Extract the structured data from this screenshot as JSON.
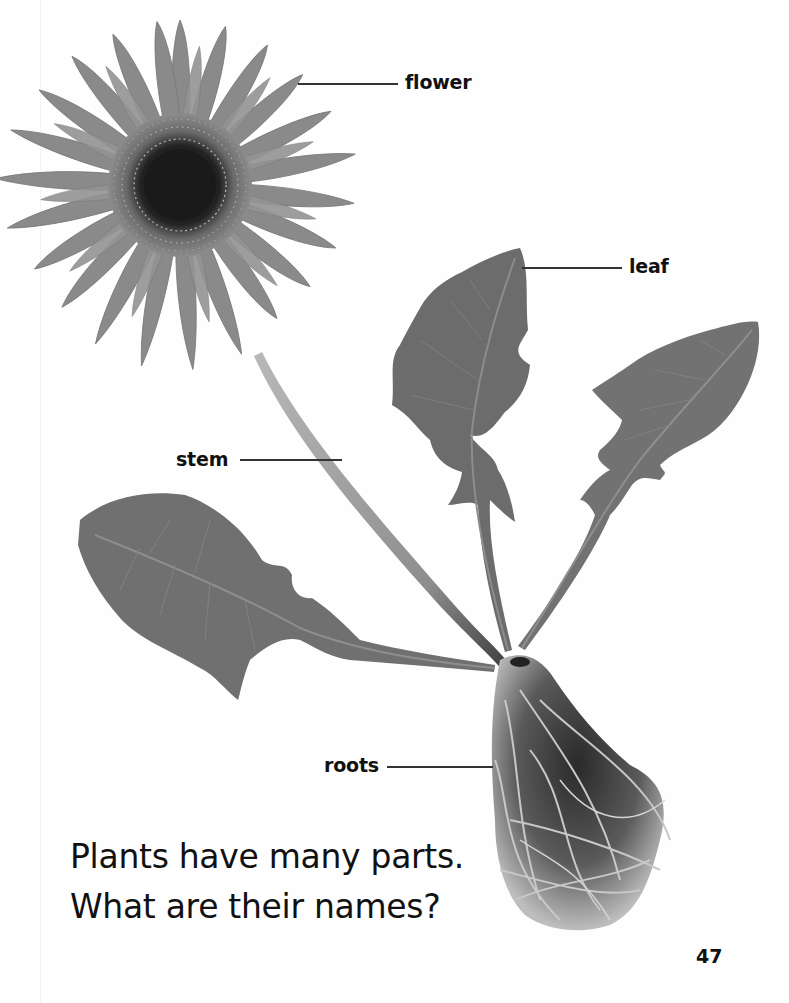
{
  "page": {
    "number": "47",
    "caption": {
      "line1": "Plants have many parts.",
      "line2": "What are their names?"
    }
  },
  "diagram": {
    "labels": {
      "flower": "flower",
      "leaf": "leaf",
      "stem": "stem",
      "roots": "roots"
    }
  },
  "colors": {
    "background": "#ffffff",
    "petal": "#8a8a8a",
    "flower_center": "#1c1c1c",
    "leaf": "#6e6e6e",
    "stem": "#a6a6a6",
    "text": "#111111",
    "leader_line": "#333333"
  }
}
